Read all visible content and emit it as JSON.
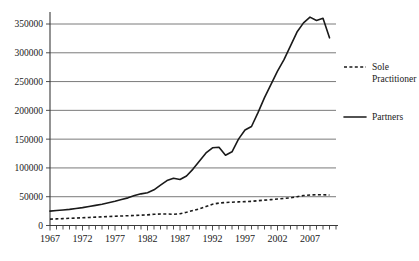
{
  "chart_data": {
    "type": "line",
    "title": "",
    "xlabel": "",
    "ylabel": "",
    "xlim": [
      1967,
      2011
    ],
    "ylim": [
      0,
      375000
    ],
    "yticks": [
      0,
      50000,
      100000,
      150000,
      200000,
      250000,
      300000,
      350000
    ],
    "ytick_labels": [
      "0",
      "50000",
      "100000",
      "150000",
      "200000",
      "250000",
      "300000",
      "350000"
    ],
    "xticks": [
      1967,
      1972,
      1977,
      1982,
      1987,
      1992,
      1997,
      2002,
      2007
    ],
    "xtick_labels": [
      "1967",
      "1972",
      "1977",
      "1982",
      "1987",
      "1992",
      "1997",
      "2002",
      "2007"
    ],
    "xtick_minor_interval": 1,
    "grid": "horizontal",
    "legend_position": "right",
    "x": [
      1967,
      1968,
      1969,
      1970,
      1971,
      1972,
      1973,
      1974,
      1975,
      1976,
      1977,
      1978,
      1979,
      1980,
      1981,
      1982,
      1983,
      1984,
      1985,
      1986,
      1987,
      1988,
      1989,
      1990,
      1991,
      1992,
      1993,
      1994,
      1995,
      1996,
      1997,
      1998,
      1999,
      2000,
      2001,
      2002,
      2003,
      2004,
      2005,
      2006,
      2007,
      2008,
      2009,
      2010
    ],
    "series": [
      {
        "name": "Partners",
        "style": "solid",
        "color": "#1a1a1a",
        "values": [
          25000,
          26000,
          27000,
          28000,
          29500,
          31000,
          33000,
          35000,
          37000,
          39500,
          42000,
          45000,
          48000,
          52000,
          55000,
          57000,
          62000,
          70000,
          78000,
          82000,
          80000,
          86000,
          98000,
          112000,
          126000,
          135000,
          136000,
          122000,
          128000,
          150000,
          166000,
          172000,
          196000,
          222000,
          245000,
          268000,
          288000,
          312000,
          336000,
          352000,
          362000,
          356000,
          360000,
          326000
        ]
      },
      {
        "name": "Sole Practitioner",
        "style": "dashed",
        "color": "#1a1a1a",
        "values": [
          11000,
          11500,
          12000,
          12500,
          13000,
          13500,
          14000,
          14500,
          15000,
          15500,
          16000,
          16500,
          17000,
          17500,
          18000,
          18500,
          19500,
          20000,
          20000,
          19500,
          20500,
          23000,
          26000,
          29000,
          33000,
          37000,
          39000,
          40000,
          40500,
          41000,
          41500,
          42000,
          43000,
          44000,
          45000,
          46000,
          47000,
          48000,
          50000,
          52000,
          53000,
          53500,
          53500,
          53000
        ]
      }
    ]
  },
  "legend": {
    "items": [
      {
        "label_line1": "Sole",
        "label_line2": "Practitioner",
        "style": "dashed"
      },
      {
        "label_line1": "Partners",
        "label_line2": "",
        "style": "solid"
      }
    ]
  }
}
